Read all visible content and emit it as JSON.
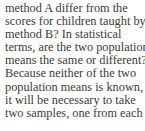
{
  "paragraph": {
    "lines": [
      "method A differ from the",
      "scores for children taught by",
      "method B? In statistical",
      "terms, are the two population",
      "means the same or different?",
      "Because neither of the two",
      "population means is known,",
      "it will be necessary to take",
      "two samples, one from each"
    ]
  }
}
